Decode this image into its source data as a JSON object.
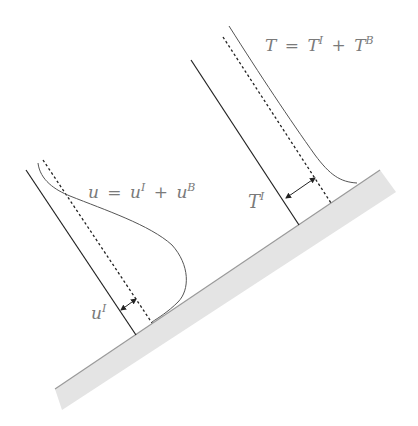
{
  "diagram": {
    "wall": {
      "fill": "#e4e4e4",
      "edge": "#9a9a9a"
    },
    "velocity_profile": {
      "equation": {
        "lhs": "u",
        "eq": "=",
        "t1": "u",
        "t1_sup": "I",
        "plus": "+",
        "t2": "u",
        "t2_sup": "B"
      },
      "offset_label": {
        "base": "u",
        "sup": "I"
      }
    },
    "temperature_profile": {
      "equation": {
        "lhs": "T",
        "eq": "=",
        "t1": "T",
        "t1_sup": "I",
        "plus": "+",
        "t2": "T",
        "t2_sup": "B"
      },
      "offset_label": {
        "base": "T",
        "sup": "I"
      }
    },
    "colors": {
      "solid_line": "#222222",
      "curve": "#555555",
      "label": "#7a7a7a"
    }
  }
}
